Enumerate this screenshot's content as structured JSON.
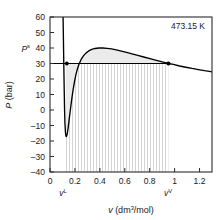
{
  "chart_data": {
    "type": "line",
    "title": "",
    "subtitle": "",
    "xlabel": "v (dm3/mol)",
    "ylabel": "P (bar)",
    "xlim": [
      0,
      1.3
    ],
    "ylim": [
      -40,
      60
    ],
    "grid": false,
    "legend_position": "none",
    "xticks": [
      0,
      0.2,
      0.4,
      0.6,
      0.8,
      1,
      1.2
    ],
    "xtick_labels": [
      "0",
      "0.2",
      "0.4",
      "0.6",
      "0.8",
      "1",
      "1.2"
    ],
    "yticks": [
      -40,
      -30,
      -20,
      -10,
      0,
      10,
      20,
      30,
      40,
      50,
      60
    ],
    "ytick_labels": [
      "-40",
      "-30",
      "-20",
      "-10",
      "0",
      "10",
      "20",
      "30",
      "40",
      "50",
      "60"
    ],
    "annotations": [
      {
        "name": "temperature",
        "text": "473.15 K",
        "x": 1.12,
        "y": 54
      },
      {
        "name": "saturation-pressure-label",
        "text": "Ps",
        "base": "P",
        "sup": "s",
        "x": -0.06,
        "y": 30
      },
      {
        "name": "liquid-volume-label",
        "text": "vL",
        "base": "v",
        "sup": "L",
        "x": 0.135,
        "y": -47
      },
      {
        "name": "vapor-volume-label",
        "text": "vV",
        "base": "v",
        "sup": "V",
        "x": 0.95,
        "y": -47
      }
    ],
    "series": [
      {
        "name": "van-der-waals-isotherm",
        "color": "#000000",
        "x": [
          0.105,
          0.108,
          0.111,
          0.114,
          0.117,
          0.12,
          0.124,
          0.128,
          0.132,
          0.136,
          0.14,
          0.145,
          0.15,
          0.156,
          0.163,
          0.17,
          0.178,
          0.187,
          0.197,
          0.208,
          0.22,
          0.234,
          0.25,
          0.268,
          0.288,
          0.31,
          0.335,
          0.362,
          0.392,
          0.424,
          0.458,
          0.494,
          0.532,
          0.572,
          0.614,
          0.658,
          0.704,
          0.752,
          0.802,
          0.854,
          0.908,
          0.95,
          0.99,
          1.04,
          1.09,
          1.14,
          1.19,
          1.24,
          1.29,
          1.3
        ],
        "y": [
          60.0,
          44.0,
          28.0,
          13.0,
          0.0,
          -8.5,
          -14.5,
          -16.9,
          -17.1,
          -16.2,
          -14.6,
          -11.8,
          -8.6,
          -4.6,
          -0.3,
          4.2,
          9.0,
          13.8,
          18.5,
          22.8,
          26.5,
          29.8,
          32.6,
          34.9,
          36.7,
          38.1,
          39.1,
          39.7,
          40.0,
          40.0,
          39.8,
          39.4,
          38.8,
          38.0,
          37.2,
          36.2,
          35.2,
          34.2,
          33.1,
          32.0,
          30.9,
          30.0,
          29.4,
          28.4,
          27.6,
          26.8,
          26.1,
          25.4,
          24.8,
          24.6
        ]
      },
      {
        "name": "saturation-tie-line",
        "color": "#000000",
        "x": [
          0.105,
          0.95
        ],
        "y": [
          30.0,
          30.0
        ]
      }
    ],
    "markers": [
      {
        "name": "liquid-point",
        "x": 0.135,
        "y": 30.0
      },
      {
        "name": "vapor-point",
        "x": 0.95,
        "y": 30.0
      }
    ],
    "shaded_region": {
      "name": "two-phase-hatch-region",
      "x_start": 0.128,
      "x_end": 0.95,
      "y_top": 30.0,
      "y_bottom": -40.0,
      "pattern": "vertical-lines",
      "color": "#c8c8c8"
    },
    "fill_region": {
      "name": "maxwell-loop-fill",
      "color": "#ebebeb"
    }
  }
}
